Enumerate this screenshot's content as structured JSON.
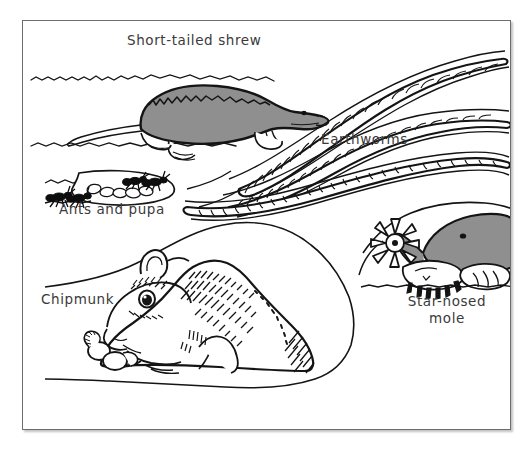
{
  "figure": {
    "background_color": "#ffffff",
    "frame_border_color": "#6d6d6d",
    "ink_color": "#111111",
    "fur_gray": "#8f8f8f",
    "soil_line_color": "#1a1a1a"
  },
  "labels": {
    "shrew": "Short-tailed shrew",
    "earthworms": "Earthworms",
    "ants": "Ants and pupa",
    "chipmunk": "Chipmunk",
    "mole_line1": "Star-nosed",
    "mole_line2": "mole"
  },
  "subjects": [
    {
      "name": "short-tailed shrew",
      "label": "Short-tailed shrew",
      "fill": "#8f8f8f",
      "position": "upper-left",
      "description": "Gray-furred shrew in profile facing right inside a horizontal tunnel, long pointed snout, small black eye, short tail, pale feet"
    },
    {
      "name": "earthworms",
      "label": "Earthworms",
      "fill": "#ffffff",
      "position": "right",
      "count": 3,
      "description": "Three segmented white worms with black outlines winding through diagonal tunnels"
    },
    {
      "name": "ants and pupa",
      "label": "Ants and pupa",
      "fill": "#111111",
      "position": "mid-left",
      "description": "Two black ants beside a cluster of pale oval pupae inside a small chamber"
    },
    {
      "name": "chipmunk",
      "label": "Chipmunk",
      "fill": "#ffffff",
      "position": "bottom-center",
      "description": "White chipmunk curled in a large burrow chamber with hatched back stripes, large eye, holding acorns"
    },
    {
      "name": "star-nosed mole",
      "label": "Star-nosed mole",
      "fill": "#8f8f8f",
      "position": "bottom-right",
      "description": "Gray mole with radiating star-shaped nose and broad pale digging claws"
    }
  ]
}
